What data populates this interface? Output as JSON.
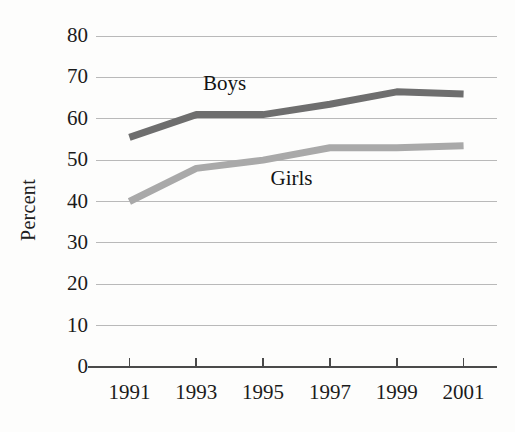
{
  "chart_data": {
    "type": "line",
    "title": "",
    "subtitle": "",
    "xlabel": "",
    "ylabel": "Percent",
    "categories": [
      "1991",
      "1993",
      "1995",
      "1997",
      "1999",
      "2001"
    ],
    "x": [
      1991,
      1993,
      1995,
      1997,
      1999,
      2001
    ],
    "xlim": [
      1990,
      2002
    ],
    "ylim": [
      0,
      80
    ],
    "ytick_labels": [
      "0",
      "10",
      "20",
      "30",
      "40",
      "50",
      "60",
      "70",
      "80"
    ],
    "yticks": [
      0,
      10,
      20,
      30,
      40,
      50,
      60,
      70,
      80
    ],
    "grid": "horizontal",
    "legend_position": "inline-annotations",
    "series": [
      {
        "name": "Boys",
        "color": "#6e6e6e",
        "values": [
          55.5,
          61,
          61,
          63.5,
          66.5,
          66
        ],
        "label": "Boys",
        "label_x": 1994.1,
        "label_y": 68.5
      },
      {
        "name": "Girls",
        "color": "#a9a9a9",
        "values": [
          40,
          48,
          50,
          53,
          53,
          53.5
        ],
        "label": "Girls",
        "label_x": 1996.0,
        "label_y": 45.5
      }
    ],
    "annotations": [
      {
        "text": "Boys",
        "series": "Boys"
      },
      {
        "text": "Girls",
        "series": "Girls"
      }
    ]
  },
  "colors": {
    "boys_line": "#6e6e6e",
    "girls_line": "#a9a9a9",
    "gridline": "#b9b9b9",
    "axis": "#4a4a4a",
    "text": "#1b1b1b",
    "background": "#fdfdfc"
  }
}
